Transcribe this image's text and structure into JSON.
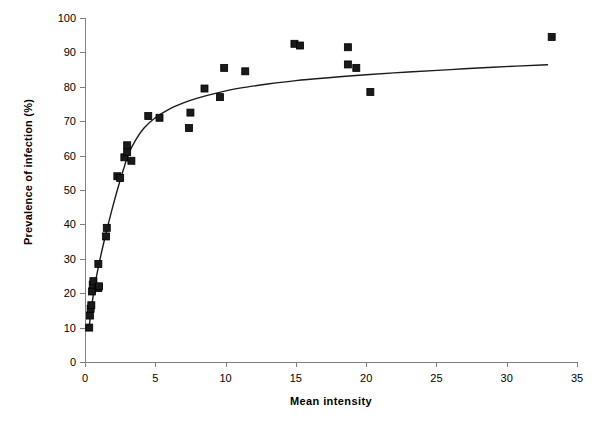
{
  "chart_data": {
    "type": "scatter",
    "title": "",
    "xlabel": "Mean intensity",
    "ylabel": "Prevalence of infection (%)",
    "xlim": [
      0,
      35
    ],
    "ylim": [
      0,
      100
    ],
    "xticks": [
      "0",
      "5",
      "10",
      "15",
      "20",
      "25",
      "30",
      "35"
    ],
    "yticks": [
      "0",
      "10",
      "20",
      "30",
      "40",
      "50",
      "60",
      "70",
      "80",
      "90",
      "100"
    ],
    "grid": false,
    "legend": "none",
    "marker_style": "filled-square",
    "marker_color": "#1a1a1a",
    "line_color": "#1a1a1a",
    "axis_color": "#808080",
    "points": [
      {
        "x": 0.3,
        "y": 10.0
      },
      {
        "x": 0.35,
        "y": 13.5
      },
      {
        "x": 0.4,
        "y": 15.5
      },
      {
        "x": 0.45,
        "y": 16.5
      },
      {
        "x": 0.5,
        "y": 20.5
      },
      {
        "x": 0.55,
        "y": 22.5
      },
      {
        "x": 0.6,
        "y": 23.5
      },
      {
        "x": 0.95,
        "y": 21.5
      },
      {
        "x": 1.0,
        "y": 22.0
      },
      {
        "x": 0.95,
        "y": 28.5
      },
      {
        "x": 1.5,
        "y": 36.5
      },
      {
        "x": 1.55,
        "y": 39.0
      },
      {
        "x": 2.3,
        "y": 54.0
      },
      {
        "x": 2.5,
        "y": 53.5
      },
      {
        "x": 2.8,
        "y": 59.5
      },
      {
        "x": 3.0,
        "y": 61.0
      },
      {
        "x": 3.0,
        "y": 63.0
      },
      {
        "x": 3.3,
        "y": 58.5
      },
      {
        "x": 4.5,
        "y": 71.5
      },
      {
        "x": 5.3,
        "y": 71.0
      },
      {
        "x": 7.4,
        "y": 68.0
      },
      {
        "x": 7.5,
        "y": 72.5
      },
      {
        "x": 8.5,
        "y": 79.5
      },
      {
        "x": 9.6,
        "y": 77.0
      },
      {
        "x": 9.9,
        "y": 85.5
      },
      {
        "x": 11.4,
        "y": 84.5
      },
      {
        "x": 14.9,
        "y": 92.5
      },
      {
        "x": 15.3,
        "y": 92.0
      },
      {
        "x": 18.7,
        "y": 91.5
      },
      {
        "x": 18.7,
        "y": 86.5
      },
      {
        "x": 19.3,
        "y": 85.5
      },
      {
        "x": 20.3,
        "y": 78.5
      },
      {
        "x": 33.2,
        "y": 94.5
      }
    ],
    "fit_curve": [
      {
        "x": 0.28,
        "y": 9.5
      },
      {
        "x": 0.5,
        "y": 17.0
      },
      {
        "x": 0.8,
        "y": 24.5
      },
      {
        "x": 1.1,
        "y": 30.5
      },
      {
        "x": 1.5,
        "y": 37.5
      },
      {
        "x": 1.9,
        "y": 44.0
      },
      {
        "x": 2.3,
        "y": 50.0
      },
      {
        "x": 2.7,
        "y": 55.5
      },
      {
        "x": 3.1,
        "y": 60.5
      },
      {
        "x": 3.6,
        "y": 64.5
      },
      {
        "x": 4.2,
        "y": 68.0
      },
      {
        "x": 5.0,
        "y": 71.0
      },
      {
        "x": 6.0,
        "y": 73.5
      },
      {
        "x": 7.0,
        "y": 75.3
      },
      {
        "x": 8.0,
        "y": 76.7
      },
      {
        "x": 9.5,
        "y": 78.3
      },
      {
        "x": 11.0,
        "y": 79.6
      },
      {
        "x": 13.0,
        "y": 80.8
      },
      {
        "x": 15.0,
        "y": 81.8
      },
      {
        "x": 17.5,
        "y": 82.7
      },
      {
        "x": 20.0,
        "y": 83.5
      },
      {
        "x": 23.0,
        "y": 84.3
      },
      {
        "x": 26.0,
        "y": 85.0
      },
      {
        "x": 29.0,
        "y": 85.7
      },
      {
        "x": 32.9,
        "y": 86.4
      }
    ]
  }
}
